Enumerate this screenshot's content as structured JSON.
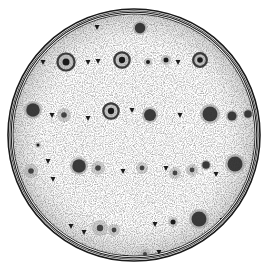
{
  "image": {
    "subject": "Petri dish with bacterial colonies (engraved illustration)",
    "width": 267,
    "height": 268,
    "colors": {
      "background": "#ffffff",
      "ink": "#1a1a1a",
      "halo": "#9a9a9a",
      "stipple": "#cfcfcf"
    }
  },
  "dish": {
    "cx": 134,
    "cy": 135,
    "r_outer": 126,
    "r_inner": 121
  },
  "colonies": [
    {
      "x": 66,
      "y": 62,
      "r": 10,
      "type": "ring"
    },
    {
      "x": 122,
      "y": 60,
      "r": 9,
      "type": "ring"
    },
    {
      "x": 140,
      "y": 28,
      "r": 7,
      "type": "blot"
    },
    {
      "x": 200,
      "y": 60,
      "r": 8,
      "type": "ring"
    },
    {
      "x": 148,
      "y": 62,
      "r": 4,
      "type": "small"
    },
    {
      "x": 166,
      "y": 60,
      "r": 5,
      "type": "small"
    },
    {
      "x": 33,
      "y": 110,
      "r": 9,
      "type": "blot"
    },
    {
      "x": 64,
      "y": 115,
      "r": 7,
      "type": "halo"
    },
    {
      "x": 111,
      "y": 111,
      "r": 9,
      "type": "ring"
    },
    {
      "x": 150,
      "y": 115,
      "r": 8,
      "type": "blot"
    },
    {
      "x": 210,
      "y": 114,
      "r": 10,
      "type": "blot"
    },
    {
      "x": 232,
      "y": 116,
      "r": 6,
      "type": "blot"
    },
    {
      "x": 248,
      "y": 114,
      "r": 5,
      "type": "blot"
    },
    {
      "x": 31,
      "y": 171,
      "r": 7,
      "type": "halo"
    },
    {
      "x": 79,
      "y": 166,
      "r": 9,
      "type": "blot"
    },
    {
      "x": 98,
      "y": 168,
      "r": 7,
      "type": "halo"
    },
    {
      "x": 142,
      "y": 168,
      "r": 6,
      "type": "halo"
    },
    {
      "x": 175,
      "y": 173,
      "r": 6,
      "type": "halo"
    },
    {
      "x": 192,
      "y": 170,
      "r": 6,
      "type": "halo"
    },
    {
      "x": 206,
      "y": 165,
      "r": 5,
      "type": "blot"
    },
    {
      "x": 235,
      "y": 164,
      "r": 10,
      "type": "blot"
    },
    {
      "x": 100,
      "y": 228,
      "r": 8,
      "type": "halo"
    },
    {
      "x": 114,
      "y": 230,
      "r": 6,
      "type": "halo"
    },
    {
      "x": 173,
      "y": 222,
      "r": 5,
      "type": "small"
    },
    {
      "x": 199,
      "y": 219,
      "r": 10,
      "type": "blot"
    },
    {
      "x": 145,
      "y": 254,
      "r": 5,
      "type": "halo"
    },
    {
      "x": 38,
      "y": 145,
      "r": 3,
      "type": "small"
    }
  ],
  "specks": [
    {
      "x": 97,
      "y": 27
    },
    {
      "x": 88,
      "y": 62
    },
    {
      "x": 98,
      "y": 61
    },
    {
      "x": 178,
      "y": 62
    },
    {
      "x": 43,
      "y": 62
    },
    {
      "x": 52,
      "y": 115
    },
    {
      "x": 88,
      "y": 118
    },
    {
      "x": 132,
      "y": 110
    },
    {
      "x": 180,
      "y": 115
    },
    {
      "x": 48,
      "y": 161
    },
    {
      "x": 53,
      "y": 179
    },
    {
      "x": 123,
      "y": 171
    },
    {
      "x": 166,
      "y": 168
    },
    {
      "x": 216,
      "y": 174
    },
    {
      "x": 71,
      "y": 226
    },
    {
      "x": 84,
      "y": 232
    },
    {
      "x": 155,
      "y": 224
    },
    {
      "x": 222,
      "y": 220
    },
    {
      "x": 159,
      "y": 252
    },
    {
      "x": 126,
      "y": 257
    }
  ]
}
